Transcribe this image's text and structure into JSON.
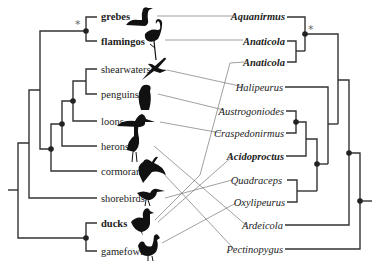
{
  "diagram": {
    "type": "tanglegram",
    "left_tree_label": "hosts (birds)",
    "right_tree_label": "parasites (lice)"
  },
  "hosts": [
    {
      "id": "grebes",
      "label": "grebes",
      "bold": true,
      "y": 17,
      "icon": "grebe-silhouette"
    },
    {
      "id": "flamingos",
      "label": "flamingos",
      "bold": true,
      "y": 41,
      "icon": "flamingo-silhouette"
    },
    {
      "id": "shearwaters",
      "label": "shearwaters",
      "bold": false,
      "y": 69,
      "icon": "shearwater-silhouette"
    },
    {
      "id": "penguins",
      "label": "penguins",
      "bold": false,
      "y": 94,
      "icon": "penguin-silhouette"
    },
    {
      "id": "loons",
      "label": "loons",
      "bold": false,
      "y": 121,
      "icon": "loon-silhouette"
    },
    {
      "id": "herons",
      "label": "herons",
      "bold": false,
      "y": 146,
      "icon": "heron-silhouette"
    },
    {
      "id": "cormorants",
      "label": "cormorants",
      "bold": false,
      "y": 171,
      "icon": "cormorant-silhouette"
    },
    {
      "id": "shorebirds",
      "label": "shorebirds",
      "bold": false,
      "y": 198,
      "icon": "shorebird-silhouette"
    },
    {
      "id": "ducks",
      "label": "ducks",
      "bold": true,
      "y": 223,
      "icon": "duck-silhouette"
    },
    {
      "id": "gamefowl",
      "label": "gamefowl",
      "bold": false,
      "y": 251,
      "icon": "rooster-silhouette"
    }
  ],
  "parasites": [
    {
      "id": "aquanirmus",
      "label": "Aquanirmus",
      "bold": true,
      "y": 17
    },
    {
      "id": "anaticola1",
      "label": "Anaticola",
      "bold": true,
      "y": 41
    },
    {
      "id": "anaticola2",
      "label": "Anaticola",
      "bold": true,
      "y": 62
    },
    {
      "id": "halipeurus",
      "label": "Halipeurus",
      "bold": false,
      "y": 87
    },
    {
      "id": "austrogoniodes",
      "label": "Austrogoniodes",
      "bold": false,
      "y": 111
    },
    {
      "id": "craspedonirmus",
      "label": "Craspedonirmus",
      "bold": false,
      "y": 133
    },
    {
      "id": "acidoproctus",
      "label": "Acidoproctus",
      "bold": true,
      "y": 156
    },
    {
      "id": "quadraceps",
      "label": "Quadraceps",
      "bold": false,
      "y": 180
    },
    {
      "id": "oxylipeurus",
      "label": "Oxylipeurus",
      "bold": false,
      "y": 202
    },
    {
      "id": "ardeicola",
      "label": "Ardeicola",
      "bold": false,
      "y": 225
    },
    {
      "id": "pectinopygus",
      "label": "Pectinopygus",
      "bold": false,
      "y": 249
    }
  ],
  "associations": [
    {
      "host": "grebes",
      "parasite": "aquanirmus"
    },
    {
      "host": "flamingos",
      "parasite": "anaticola1"
    },
    {
      "host": "shearwaters",
      "parasite": "halipeurus"
    },
    {
      "host": "penguins",
      "parasite": "austrogoniodes"
    },
    {
      "host": "loons",
      "parasite": "craspedonirmus"
    },
    {
      "host": "herons",
      "parasite": "ardeicola"
    },
    {
      "host": "cormorants",
      "parasite": "pectinopygus"
    },
    {
      "host": "shorebirds",
      "parasite": "quadraceps"
    },
    {
      "host": "ducks",
      "parasite": "anaticola2"
    },
    {
      "host": "ducks",
      "parasite": "acidoproctus"
    },
    {
      "host": "gamefowl",
      "parasite": "oxylipeurus"
    }
  ],
  "annotations": {
    "left_star": "*",
    "right_star": "*"
  },
  "colors": {
    "branch": "#333333",
    "link": "#777777",
    "node": "#222222",
    "text": "#222222"
  }
}
